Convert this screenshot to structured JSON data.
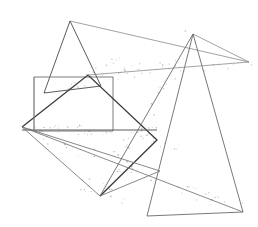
{
  "figure": {
    "title": "",
    "width": 258,
    "height": 227,
    "background_color": "#ffffff",
    "colors": {
      "stroke_dark": "#3a3a3a",
      "stroke_mid": "#6b6b6b",
      "stroke_light": "#8f8f8f",
      "noise": "#9a9a9a",
      "background": "#ffffff"
    },
    "shapes": [
      {
        "name": "left-triangle",
        "type": "polygon",
        "stroke": "#4a4a4a",
        "stroke_width": 0.9,
        "points": "70,21 44,93 101,86 70,21"
      },
      {
        "name": "upper-quadrilateral",
        "type": "polyline",
        "stroke": "#8a8a8a",
        "stroke_width": 0.8,
        "points": "70,21 249,62 193,34"
      },
      {
        "name": "left-rectangle",
        "type": "polygon",
        "stroke": "#6e6e6e",
        "stroke_width": 0.9,
        "points": "34,77 113,77 113,131 34,131 34,77"
      },
      {
        "name": "right-triangle",
        "type": "polygon",
        "stroke": "#6a6a6a",
        "stroke_width": 0.9,
        "points": "193,34 147,216 243,212 193,34"
      },
      {
        "name": "central-chevron",
        "type": "polyline",
        "stroke": "#3a3a3a",
        "stroke_width": 1.3,
        "points": "22,127 88,75 157,140 100,196"
      },
      {
        "name": "lower-left-wedge",
        "type": "polyline",
        "stroke": "#7a7a7a",
        "stroke_width": 0.9,
        "points": "22,127 100,196 160,171 22,127"
      },
      {
        "name": "long-diagonal-right",
        "type": "polyline",
        "stroke": "#7d7d7d",
        "stroke_width": 0.9,
        "points": "22,127 243,212"
      },
      {
        "name": "upper-right-diagonal",
        "type": "polyline",
        "stroke": "#8a8a8a",
        "stroke_width": 0.8,
        "points": "88,75 249,62"
      },
      {
        "name": "horizontal-baseline",
        "type": "polyline",
        "stroke": "#5c5c5c",
        "stroke_width": 1.0,
        "points": "22,130 157,130"
      },
      {
        "name": "apex-descender",
        "type": "polyline",
        "stroke": "#6a6a6a",
        "stroke_width": 0.9,
        "points": "193,34 100,196"
      },
      {
        "name": "rectangle-left-spur",
        "type": "polyline",
        "stroke": "#8a8a8a",
        "stroke_width": 0.8,
        "points": "34,131 34,77"
      }
    ],
    "noise_paths": [
      {
        "name": "noise-along-upper-right-diagonal",
        "from": [
          88,
          75
        ],
        "to": [
          249,
          62
        ],
        "count": 46,
        "spread": 7
      },
      {
        "name": "noise-along-long-diagonal",
        "from": [
          22,
          127
        ],
        "to": [
          243,
          212
        ],
        "count": 52,
        "spread": 7
      },
      {
        "name": "noise-along-apex-descender",
        "from": [
          193,
          34
        ],
        "to": [
          100,
          196
        ],
        "count": 44,
        "spread": 8
      },
      {
        "name": "noise-along-horizontal-baseline",
        "from": [
          22,
          130
        ],
        "to": [
          157,
          130
        ],
        "count": 38,
        "spread": 5
      },
      {
        "name": "noise-around-central-junction",
        "from": [
          60,
          95
        ],
        "to": [
          120,
          60
        ],
        "count": 22,
        "spread": 9
      },
      {
        "name": "noise-around-bottom-vertex",
        "from": [
          88,
          186
        ],
        "to": [
          120,
          200
        ],
        "count": 16,
        "spread": 8
      },
      {
        "name": "noise-around-mid-right-junction",
        "from": [
          140,
          128
        ],
        "to": [
          175,
          150
        ],
        "count": 18,
        "spread": 8
      }
    ]
  }
}
